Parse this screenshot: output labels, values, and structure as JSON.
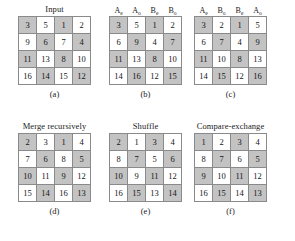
{
  "figure": {
    "shaded_color": "#c3c3c3",
    "cell_color": "#ffffff",
    "border_color": "#8a8a8a"
  },
  "panels": [
    {
      "id": "a",
      "title": "Input",
      "caption": "(a)",
      "headers": [],
      "rows": [
        [
          {
            "v": "3",
            "s": true
          },
          {
            "v": "5",
            "s": false
          },
          {
            "v": "1",
            "s": true
          },
          {
            "v": "2",
            "s": false
          }
        ],
        [
          {
            "v": "9",
            "s": false
          },
          {
            "v": "6",
            "s": true
          },
          {
            "v": "7",
            "s": false
          },
          {
            "v": "4",
            "s": true
          }
        ],
        [
          {
            "v": "11",
            "s": true
          },
          {
            "v": "13",
            "s": false
          },
          {
            "v": "8",
            "s": true
          },
          {
            "v": "10",
            "s": false
          }
        ],
        [
          {
            "v": "16",
            "s": false
          },
          {
            "v": "14",
            "s": true
          },
          {
            "v": "15",
            "s": false
          },
          {
            "v": "12",
            "s": true
          }
        ]
      ]
    },
    {
      "id": "b",
      "title": "",
      "caption": "(b)",
      "headers": [
        {
          "base": "A",
          "sub": "e"
        },
        {
          "base": "A",
          "sub": "o"
        },
        {
          "base": "B",
          "sub": "e"
        },
        {
          "base": "B",
          "sub": "o"
        }
      ],
      "rows": [
        [
          {
            "v": "3",
            "s": true
          },
          {
            "v": "5",
            "s": false
          },
          {
            "v": "1",
            "s": true
          },
          {
            "v": "2",
            "s": false
          }
        ],
        [
          {
            "v": "6",
            "s": false
          },
          {
            "v": "9",
            "s": true
          },
          {
            "v": "4",
            "s": false
          },
          {
            "v": "7",
            "s": true
          }
        ],
        [
          {
            "v": "11",
            "s": true
          },
          {
            "v": "13",
            "s": false
          },
          {
            "v": "8",
            "s": true
          },
          {
            "v": "10",
            "s": false
          }
        ],
        [
          {
            "v": "14",
            "s": false
          },
          {
            "v": "16",
            "s": true
          },
          {
            "v": "12",
            "s": false
          },
          {
            "v": "15",
            "s": true
          }
        ]
      ]
    },
    {
      "id": "c",
      "title": "",
      "caption": "(c)",
      "headers": [
        {
          "base": "A",
          "sub": "e"
        },
        {
          "base": "B",
          "sub": "o"
        },
        {
          "base": "B",
          "sub": "e"
        },
        {
          "base": "A",
          "sub": "o"
        }
      ],
      "rows": [
        [
          {
            "v": "3",
            "s": true
          },
          {
            "v": "2",
            "s": false
          },
          {
            "v": "1",
            "s": true
          },
          {
            "v": "5",
            "s": false
          }
        ],
        [
          {
            "v": "6",
            "s": false
          },
          {
            "v": "7",
            "s": true
          },
          {
            "v": "4",
            "s": false
          },
          {
            "v": "9",
            "s": true
          }
        ],
        [
          {
            "v": "11",
            "s": true
          },
          {
            "v": "10",
            "s": false
          },
          {
            "v": "8",
            "s": true
          },
          {
            "v": "13",
            "s": false
          }
        ],
        [
          {
            "v": "14",
            "s": false
          },
          {
            "v": "15",
            "s": true
          },
          {
            "v": "12",
            "s": false
          },
          {
            "v": "16",
            "s": true
          }
        ]
      ]
    },
    {
      "id": "d",
      "title": "Merge recursively",
      "caption": "(d)",
      "headers": [],
      "rows": [
        [
          {
            "v": "2",
            "s": true
          },
          {
            "v": "3",
            "s": false
          },
          {
            "v": "1",
            "s": true
          },
          {
            "v": "4",
            "s": false
          }
        ],
        [
          {
            "v": "7",
            "s": false
          },
          {
            "v": "6",
            "s": true
          },
          {
            "v": "8",
            "s": false
          },
          {
            "v": "5",
            "s": true
          }
        ],
        [
          {
            "v": "10",
            "s": true
          },
          {
            "v": "11",
            "s": false
          },
          {
            "v": "9",
            "s": true
          },
          {
            "v": "12",
            "s": false
          }
        ],
        [
          {
            "v": "15",
            "s": false
          },
          {
            "v": "14",
            "s": true
          },
          {
            "v": "16",
            "s": false
          },
          {
            "v": "13",
            "s": true
          }
        ]
      ]
    },
    {
      "id": "e",
      "title": "Shuffle",
      "caption": "(e)",
      "headers": [],
      "rows": [
        [
          {
            "v": "2",
            "s": true
          },
          {
            "v": "1",
            "s": false
          },
          {
            "v": "3",
            "s": true
          },
          {
            "v": "4",
            "s": false
          }
        ],
        [
          {
            "v": "8",
            "s": false
          },
          {
            "v": "7",
            "s": true
          },
          {
            "v": "5",
            "s": false
          },
          {
            "v": "6",
            "s": true
          }
        ],
        [
          {
            "v": "10",
            "s": true
          },
          {
            "v": "9",
            "s": false
          },
          {
            "v": "11",
            "s": true
          },
          {
            "v": "12",
            "s": false
          }
        ],
        [
          {
            "v": "16",
            "s": false
          },
          {
            "v": "15",
            "s": true
          },
          {
            "v": "13",
            "s": false
          },
          {
            "v": "14",
            "s": true
          }
        ]
      ]
    },
    {
      "id": "f",
      "title": "Compare-exchange",
      "caption": "(f)",
      "headers": [],
      "rows": [
        [
          {
            "v": "1",
            "s": true
          },
          {
            "v": "2",
            "s": false
          },
          {
            "v": "3",
            "s": true
          },
          {
            "v": "4",
            "s": false
          }
        ],
        [
          {
            "v": "8",
            "s": false
          },
          {
            "v": "7",
            "s": true
          },
          {
            "v": "6",
            "s": false
          },
          {
            "v": "5",
            "s": true
          }
        ],
        [
          {
            "v": "9",
            "s": true
          },
          {
            "v": "10",
            "s": false
          },
          {
            "v": "11",
            "s": true
          },
          {
            "v": "12",
            "s": false
          }
        ],
        [
          {
            "v": "16",
            "s": false
          },
          {
            "v": "15",
            "s": true
          },
          {
            "v": "14",
            "s": false
          },
          {
            "v": "13",
            "s": true
          }
        ]
      ]
    }
  ],
  "layout": {
    "rows": [
      [
        "a",
        "b",
        "c"
      ],
      [
        "d",
        "e",
        "f"
      ]
    ],
    "offsets": {
      "a": 18,
      "b": 112,
      "c": 200,
      "d": 18,
      "e": 112,
      "f": 200
    }
  }
}
